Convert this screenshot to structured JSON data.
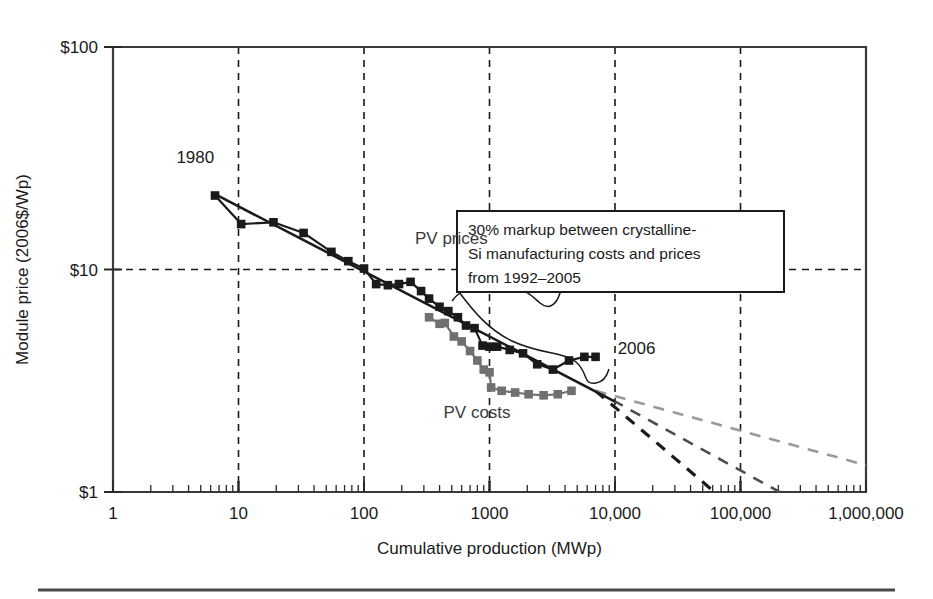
{
  "figure": {
    "background": "#ffffff",
    "rule_color": "#4a4a4a"
  },
  "chart_data": {
    "type": "line",
    "title": "",
    "xlabel": "Cumulative production (MWp)",
    "ylabel": "Module price (2006$/Wp)",
    "xscale": "log",
    "yscale": "log",
    "xlim": [
      1,
      1000000
    ],
    "ylim": [
      1,
      100
    ],
    "grid": true,
    "grid_style": "dashed",
    "legend_position": "inline-annotations",
    "xticks": [
      "1",
      "10",
      "100",
      "1000",
      "10,000",
      "100,000",
      "1,000,000"
    ],
    "xtick_values": [
      1,
      10,
      100,
      1000,
      10000,
      100000,
      1000000
    ],
    "yticks": [
      "$100",
      "$10",
      "$1"
    ],
    "ytick_values": [
      100,
      10,
      1
    ],
    "series": [
      {
        "name": "PV prices",
        "color": "#1a1a1a",
        "marker": "square",
        "points": [
          [
            6.5,
            21.5
          ],
          [
            10.5,
            16.0
          ],
          [
            19.0,
            16.3
          ],
          [
            33.0,
            14.6
          ],
          [
            55.0,
            12.0
          ],
          [
            75.0,
            10.9
          ],
          [
            100.0,
            10.1
          ],
          [
            125.0,
            8.6
          ],
          [
            155.0,
            8.5
          ],
          [
            190.0,
            8.6
          ],
          [
            235.0,
            8.8
          ],
          [
            285.0,
            8.0
          ],
          [
            330.0,
            7.4
          ],
          [
            400.0,
            6.8
          ],
          [
            470.0,
            6.5
          ],
          [
            560.0,
            6.1
          ],
          [
            650.0,
            5.6
          ],
          [
            760.0,
            5.45
          ],
          [
            880.0,
            4.55
          ],
          [
            1000.0,
            4.5
          ],
          [
            1150.0,
            4.5
          ],
          [
            1450.0,
            4.35
          ],
          [
            1850.0,
            4.2
          ],
          [
            2400.0,
            3.75
          ],
          [
            3200.0,
            3.55
          ],
          [
            4300.0,
            3.9
          ],
          [
            5700.0,
            4.05
          ],
          [
            7000.0,
            4.05
          ]
        ]
      },
      {
        "name": "PV costs",
        "color": "#707070",
        "marker": "square",
        "points": [
          [
            330.0,
            6.1
          ],
          [
            400.0,
            5.7
          ],
          [
            440.0,
            5.75
          ],
          [
            520.0,
            5.0
          ],
          [
            600.0,
            4.75
          ],
          [
            700.0,
            4.3
          ],
          [
            800.0,
            3.9
          ],
          [
            900.0,
            3.55
          ],
          [
            1000.0,
            3.45
          ],
          [
            1030.0,
            2.95
          ],
          [
            1250.0,
            2.85
          ],
          [
            1600.0,
            2.8
          ],
          [
            2050.0,
            2.75
          ],
          [
            2700.0,
            2.72
          ],
          [
            3500.0,
            2.75
          ],
          [
            4500.0,
            2.85
          ]
        ]
      }
    ],
    "trend_line": {
      "name": "experience-curve-fit",
      "color": "#1a1a1a",
      "from": [
        6.5,
        21.8
      ],
      "to": [
        10000,
        2.55
      ]
    },
    "projections": [
      {
        "name": "steep-projection",
        "color": "#1a1a1a",
        "dash": "11,9",
        "width": 3.2,
        "from": [
          7000,
          2.85
        ],
        "to": [
          62000,
          1.0
        ]
      },
      {
        "name": "medium-projection",
        "color": "#4d4d4d",
        "dash": "11,9",
        "width": 2.6,
        "from": [
          7000,
          2.85
        ],
        "to": [
          205000,
          1.0
        ]
      },
      {
        "name": "shallow-projection",
        "color": "#9a9a9a",
        "dash": "11,9",
        "width": 2.6,
        "from": [
          7000,
          2.85
        ],
        "to": [
          1000000,
          1.32
        ]
      }
    ],
    "annotations": [
      {
        "name": "year-start",
        "text": "1980",
        "x": 3.2,
        "y": 30.0
      },
      {
        "name": "year-end",
        "text": "2006",
        "x": 10500,
        "y": 4.15
      },
      {
        "name": "series-label-prices",
        "text": "PV prices",
        "x": 255,
        "y": 13.0
      },
      {
        "name": "series-label-costs",
        "text": "PV costs",
        "x": 430,
        "y": 2.15
      }
    ],
    "callout": {
      "name": "markup-callout",
      "lines": [
        "30% markup between crystalline-",
        "Si manufacturing costs and prices",
        "from 1992–2005"
      ],
      "border_color": "#1a1a1a",
      "fill": "#ffffff"
    }
  }
}
